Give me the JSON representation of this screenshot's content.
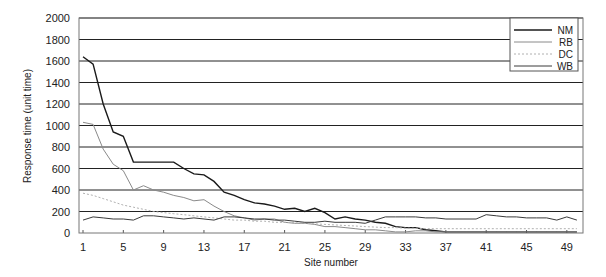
{
  "chart_data": {
    "type": "line",
    "title": "",
    "xlabel": "Site number",
    "ylabel": "Response time (unit time)",
    "ylim": [
      0,
      2000
    ],
    "yticks": [
      0,
      200,
      400,
      600,
      800,
      1000,
      1200,
      1400,
      1600,
      1800,
      2000
    ],
    "xticks": [
      1,
      5,
      9,
      13,
      17,
      21,
      25,
      29,
      33,
      37,
      41,
      45,
      49
    ],
    "xlim": [
      1,
      50
    ],
    "grid": true,
    "legend_position": "upper right",
    "x": [
      1,
      2,
      3,
      4,
      5,
      6,
      7,
      8,
      9,
      10,
      11,
      12,
      13,
      14,
      15,
      16,
      17,
      18,
      19,
      20,
      21,
      22,
      23,
      24,
      25,
      26,
      27,
      28,
      29,
      30,
      31,
      32,
      33,
      34,
      35,
      36,
      37,
      38,
      39,
      40,
      41,
      42,
      43,
      44,
      45,
      46,
      47,
      48,
      49,
      50
    ],
    "series": [
      {
        "name": "NM",
        "style": "solid-dark",
        "values": [
          1640,
          1570,
          1200,
          940,
          900,
          660,
          660,
          660,
          660,
          660,
          600,
          550,
          540,
          480,
          380,
          350,
          310,
          280,
          270,
          250,
          220,
          230,
          200,
          230,
          190,
          130,
          150,
          130,
          120,
          100,
          90,
          60,
          50,
          50,
          30,
          20,
          10,
          10,
          10,
          10,
          10,
          10,
          10,
          10,
          10,
          10,
          10,
          10,
          10,
          10
        ]
      },
      {
        "name": "RB",
        "style": "solid-light",
        "values": [
          1030,
          1010,
          780,
          640,
          580,
          400,
          440,
          400,
          380,
          350,
          330,
          300,
          310,
          250,
          200,
          160,
          140,
          120,
          130,
          130,
          100,
          90,
          90,
          80,
          60,
          60,
          50,
          40,
          30,
          30,
          20,
          10,
          10,
          20,
          20,
          10,
          10,
          10,
          10,
          10,
          10,
          10,
          10,
          10,
          10,
          10,
          10,
          10,
          10,
          10
        ]
      },
      {
        "name": "DC",
        "style": "dashed-light",
        "values": [
          370,
          350,
          320,
          290,
          260,
          240,
          220,
          200,
          190,
          180,
          170,
          160,
          150,
          140,
          130,
          120,
          120,
          110,
          110,
          100,
          100,
          95,
          90,
          85,
          80,
          75,
          70,
          65,
          60,
          55,
          50,
          50,
          45,
          45,
          40,
          40,
          40,
          40,
          40,
          40,
          40,
          40,
          40,
          40,
          40,
          40,
          40,
          40,
          40,
          40
        ]
      },
      {
        "name": "WB",
        "style": "solid-medium",
        "values": [
          120,
          150,
          140,
          130,
          130,
          120,
          160,
          160,
          150,
          140,
          130,
          140,
          130,
          120,
          150,
          150,
          140,
          130,
          130,
          120,
          120,
          110,
          100,
          100,
          110,
          100,
          100,
          100,
          90,
          120,
          150,
          150,
          150,
          150,
          140,
          140,
          130,
          130,
          130,
          130,
          170,
          160,
          150,
          150,
          140,
          140,
          140,
          120,
          150,
          120
        ]
      }
    ]
  },
  "legend": {
    "items": [
      {
        "label": "NM"
      },
      {
        "label": "RB"
      },
      {
        "label": "DC"
      },
      {
        "label": "WB"
      }
    ]
  },
  "colors": {
    "NM": "#1a1a1a",
    "RB": "#8a8a8a",
    "DC": "#b0b0b0",
    "WB": "#3a3a3a",
    "grid": "#222222",
    "frame": "#666666"
  }
}
